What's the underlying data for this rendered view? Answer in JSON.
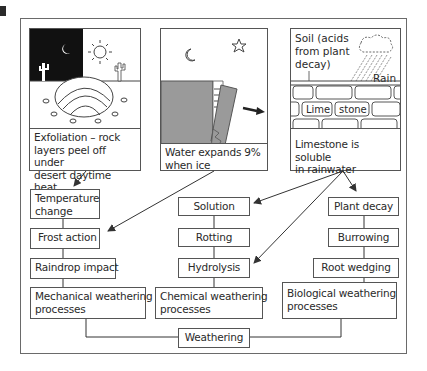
{
  "figure": {
    "panels": [
      {
        "id": "exfoliation",
        "caption": [
          "Exfoliation – rock",
          "layers peel off under",
          "desert daytime heat"
        ],
        "icons": [
          "moon-icon",
          "sun-icon",
          "cactus-icon",
          "cactus-icon",
          "rock-dome-icon"
        ]
      },
      {
        "id": "frost",
        "caption": [
          "Water expands 9%",
          "when ice"
        ],
        "icons": [
          "moon-icon",
          "star-icon",
          "rock-block-icon",
          "arrow-right-icon"
        ]
      },
      {
        "id": "limestone",
        "caption": [
          "Limestone is soluble",
          "in rainwater"
        ],
        "labels": {
          "soil": [
            "Soil (acids",
            "from plant",
            "decay)"
          ],
          "rain": "Rain",
          "lime": "Lime",
          "stone": "stone"
        },
        "icons": [
          "cloud-icon",
          "rain-icon",
          "brick-wall-icon"
        ]
      }
    ],
    "columns": {
      "mechanical": {
        "items": [
          [
            "Temperature",
            "change"
          ],
          [
            "Frost action"
          ],
          [
            "Raindrop impact"
          ]
        ],
        "total": [
          "Mechanical weathering",
          "processes"
        ]
      },
      "chemical": {
        "items": [
          [
            "Solution"
          ],
          [
            "Rotting"
          ],
          [
            "Hydrolysis"
          ]
        ],
        "total": [
          "Chemical weathering",
          "processes"
        ]
      },
      "biological": {
        "items": [
          [
            "Plant decay"
          ],
          [
            "Burrowing"
          ],
          [
            "Root wedging"
          ]
        ],
        "total": [
          "Biological weathering",
          "processes"
        ]
      }
    },
    "root": "Weathering",
    "colors": {
      "line": "#3a3a3a",
      "rock_fill": "#9a9a9a",
      "night_fill": "#111111",
      "border": "#555555"
    }
  }
}
